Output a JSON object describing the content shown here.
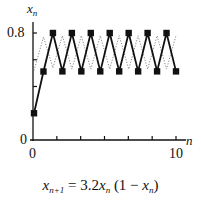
{
  "chart_data": {
    "type": "line",
    "title": "",
    "xlabel": "n",
    "ylabel": "x_n",
    "caption": "x_{n+1} = 3.2 x_n (1 − x_n)",
    "x_ticks": [
      "0",
      "10"
    ],
    "y_ticks": [
      "0",
      "0.8"
    ],
    "xlim": [
      0,
      10
    ],
    "ylim": [
      0,
      0.8
    ],
    "grid": false,
    "legend": null,
    "series": [
      {
        "name": "solid trajectory (x0 = 0.2)",
        "style": "solid-with-square-markers",
        "x": [
          0,
          0.667,
          1.333,
          2,
          2.667,
          3.333,
          4,
          4.667,
          5.333,
          6,
          6.667,
          7.333,
          8,
          8.667,
          9.333,
          10
        ],
        "values": [
          0.2,
          0.512,
          0.8,
          0.513,
          0.8,
          0.513,
          0.8,
          0.513,
          0.8,
          0.513,
          0.8,
          0.513,
          0.8,
          0.513,
          0.8,
          0.513
        ]
      },
      {
        "name": "dotted trajectory",
        "style": "dotted",
        "x": [
          0,
          0.667,
          1.333,
          2,
          2.667,
          3.333,
          4,
          4.667,
          5.333,
          6,
          6.667,
          7.333,
          8,
          8.667,
          9.333,
          10
        ],
        "values": [
          0.52,
          0.77,
          0.54,
          0.78,
          0.53,
          0.78,
          0.53,
          0.78,
          0.53,
          0.78,
          0.53,
          0.78,
          0.53,
          0.78,
          0.53,
          0.78
        ]
      }
    ]
  },
  "labels": {
    "y_axis_var": "x",
    "y_axis_sub": "n",
    "y_tick_top": "0.8",
    "y_origin": "0",
    "x_origin": "0",
    "x_tick_end": "10",
    "x_axis_var": "n",
    "caption_lhs_var": "x",
    "caption_lhs_sub": "n+1",
    "caption_eq": " = 3.2",
    "caption_x": "x",
    "caption_x_sub": "n",
    "caption_paren_open": " (1 − ",
    "caption_x2": "x",
    "caption_x2_sub": "n",
    "caption_paren_close": ")"
  }
}
